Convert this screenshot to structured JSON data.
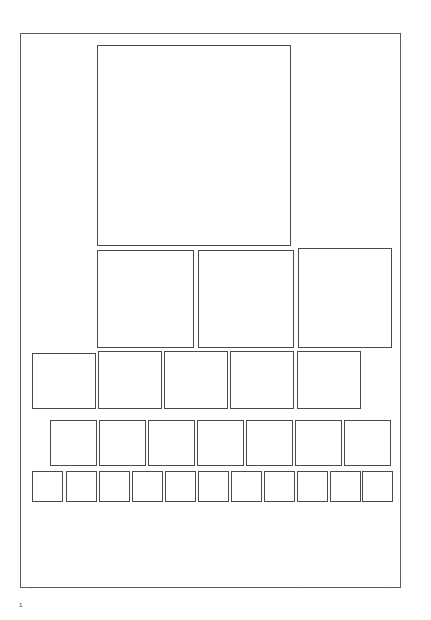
{
  "document": {
    "page_label": "1",
    "page_count_visible": "1",
    "background_color": "#ffffff",
    "page_border_color": "#5d5d5d",
    "box_border_color": "#4a4a4a",
    "guide_color": "#dcdcdc"
  },
  "page_sheet": {
    "x": 20,
    "y": 33,
    "width": 381,
    "height": 555
  },
  "guides": {
    "vertical_x": [
      31,
      302,
      390
    ],
    "horizontal_y": [
      43,
      578
    ]
  },
  "layout": {
    "rows": [
      {
        "name": "hero-row",
        "index": 1,
        "count": 1,
        "boxes": [
          {
            "label": "",
            "x": 97,
            "y": 45,
            "w": 194,
            "h": 201
          }
        ]
      },
      {
        "name": "triple-row",
        "index": 2,
        "count": 3,
        "boxes": [
          {
            "label": "",
            "x": 97,
            "y": 250,
            "w": 97,
            "h": 98
          },
          {
            "label": "",
            "x": 198,
            "y": 250,
            "w": 96,
            "h": 98
          },
          {
            "label": "",
            "x": 298,
            "y": 248,
            "w": 94,
            "h": 100
          }
        ]
      },
      {
        "name": "five-row",
        "index": 3,
        "count": 5,
        "boxes": [
          {
            "label": "",
            "x": 32,
            "y": 353,
            "w": 64,
            "h": 56
          },
          {
            "label": "",
            "x": 98,
            "y": 351,
            "w": 64,
            "h": 58
          },
          {
            "label": "",
            "x": 164,
            "y": 351,
            "w": 64,
            "h": 58
          },
          {
            "label": "",
            "x": 230,
            "y": 351,
            "w": 64,
            "h": 58
          },
          {
            "label": "",
            "x": 297,
            "y": 351,
            "w": 64,
            "h": 58
          }
        ]
      },
      {
        "name": "seven-row",
        "index": 4,
        "count": 7,
        "boxes": [
          {
            "label": "",
            "x": 50,
            "y": 420,
            "w": 47,
            "h": 46
          },
          {
            "label": "",
            "x": 99,
            "y": 420,
            "w": 47,
            "h": 46
          },
          {
            "label": "",
            "x": 148,
            "y": 420,
            "w": 47,
            "h": 46
          },
          {
            "label": "",
            "x": 197,
            "y": 420,
            "w": 47,
            "h": 46
          },
          {
            "label": "",
            "x": 246,
            "y": 420,
            "w": 47,
            "h": 46
          },
          {
            "label": "",
            "x": 295,
            "y": 420,
            "w": 47,
            "h": 46
          },
          {
            "label": "",
            "x": 344,
            "y": 420,
            "w": 47,
            "h": 46
          }
        ]
      },
      {
        "name": "eleven-row",
        "index": 5,
        "count": 11,
        "boxes": [
          {
            "label": "",
            "x": 32,
            "y": 471,
            "w": 31,
            "h": 31
          },
          {
            "label": "",
            "x": 66,
            "y": 471,
            "w": 31,
            "h": 31
          },
          {
            "label": "",
            "x": 99,
            "y": 471,
            "w": 31,
            "h": 31
          },
          {
            "label": "",
            "x": 132,
            "y": 471,
            "w": 31,
            "h": 31
          },
          {
            "label": "",
            "x": 165,
            "y": 471,
            "w": 31,
            "h": 31
          },
          {
            "label": "",
            "x": 198,
            "y": 471,
            "w": 31,
            "h": 31
          },
          {
            "label": "",
            "x": 231,
            "y": 471,
            "w": 31,
            "h": 31
          },
          {
            "label": "",
            "x": 264,
            "y": 471,
            "w": 31,
            "h": 31
          },
          {
            "label": "",
            "x": 297,
            "y": 471,
            "w": 31,
            "h": 31
          },
          {
            "label": "",
            "x": 330,
            "y": 471,
            "w": 31,
            "h": 31
          },
          {
            "label": "",
            "x": 362,
            "y": 471,
            "w": 31,
            "h": 31
          }
        ]
      }
    ]
  }
}
